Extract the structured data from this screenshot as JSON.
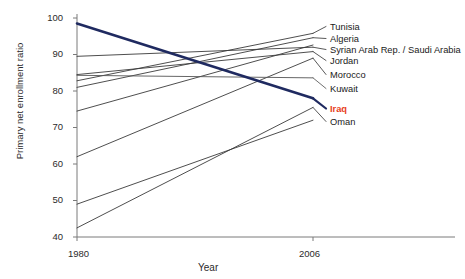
{
  "chart_data": {
    "type": "line",
    "subtype": "slopegraph",
    "title": "",
    "xlabel": "Year",
    "ylabel": "Primary net enrollment ratio",
    "x": [
      1980,
      2006
    ],
    "xticklabels": [
      "1980",
      "2006"
    ],
    "yticks": [
      40,
      50,
      60,
      70,
      80,
      90,
      100
    ],
    "yticklabels": [
      "40",
      "50",
      "60",
      "70",
      "80",
      "90",
      "100"
    ],
    "ylim": [
      38,
      101
    ],
    "grid": false,
    "legend": "right-endpoint-labels",
    "series": [
      {
        "name": "Tunisia",
        "values": [
          82.8,
          95.8
        ],
        "highlight": false,
        "color": "#3a3a3a",
        "label_index": 0
      },
      {
        "name": "Algeria",
        "values": [
          81.0,
          94.6
        ],
        "highlight": false,
        "color": "#3a3a3a",
        "label_index": 1
      },
      {
        "name": "Syrian Arab Rep. / Saudi Arabia",
        "values": [
          89.5,
          92.0
        ],
        "highlight": false,
        "color": "#3a3a3a",
        "label_index": 2
      },
      {
        "name": "Jordan",
        "values": [
          84.5,
          90.8
        ],
        "highlight": false,
        "color": "#3a3a3a",
        "label_index": 3
      },
      {
        "name": "Morocco",
        "values": [
          62.0,
          89.0
        ],
        "highlight": false,
        "color": "#3a3a3a",
        "label_index": 4
      },
      {
        "name": "Kuwait",
        "values": [
          84.3,
          83.6
        ],
        "highlight": false,
        "color": "#555555",
        "label_index": 5
      },
      {
        "name": "Iraq",
        "values": [
          98.5,
          78.0
        ],
        "highlight": true,
        "color": "#1f2a60",
        "label_index": 6
      },
      {
        "name": "Oman",
        "values": [
          42.5,
          75.5
        ],
        "highlight": false,
        "color": "#3a3a3a",
        "label_index": 7
      }
    ],
    "extra_lines": [
      {
        "name": "unlabeled-rising-line",
        "values": [
          49.0,
          72.0
        ],
        "color": "#3a3a3a"
      },
      {
        "name": "unlabeled-mid-line",
        "values": [
          74.5,
          92.6
        ],
        "color": "#3a3a3a"
      }
    ],
    "label_positions": [
      {
        "name": "Tunisia",
        "y": 22
      },
      {
        "name": "Algeria",
        "y": 34
      },
      {
        "name": "Syrian Arab Rep. / Saudi Arabia",
        "y": 45
      },
      {
        "name": "Jordan",
        "y": 56
      },
      {
        "name": "Morocco",
        "y": 70
      },
      {
        "name": "Kuwait",
        "y": 84
      },
      {
        "name": "Iraq",
        "y": 104
      },
      {
        "name": "Oman",
        "y": 117
      }
    ],
    "axis_color": "#7a7a7a",
    "highlight_color": "#e8401c",
    "highlight_line_color": "#1f2a60"
  }
}
